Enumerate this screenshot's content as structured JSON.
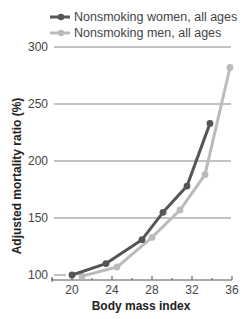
{
  "chart_data": {
    "type": "line",
    "title": "",
    "xlabel": "Body mass index",
    "ylabel": "Adjusted mortality ratio (%)",
    "xlim": [
      17.5,
      36
    ],
    "ylim": [
      100,
      300
    ],
    "x_ticks": [
      20,
      24,
      28,
      32,
      36
    ],
    "y_ticks": [
      100,
      150,
      200,
      250,
      300
    ],
    "grid": "horizontal",
    "legend_position": "top-left",
    "series": [
      {
        "name": "Nonsmoking women, all ages",
        "color": "#555555",
        "x": [
          20,
          23.4,
          27,
          29.1,
          31.5,
          33.8
        ],
        "values": [
          100,
          110,
          131,
          155,
          178,
          233
        ]
      },
      {
        "name": "Nonsmoking men, all ages",
        "color": "#bbbbbb",
        "x": [
          21,
          24.5,
          28,
          30.8,
          33.3,
          35.8
        ],
        "values": [
          99,
          107,
          133,
          157,
          188,
          282
        ]
      }
    ]
  }
}
